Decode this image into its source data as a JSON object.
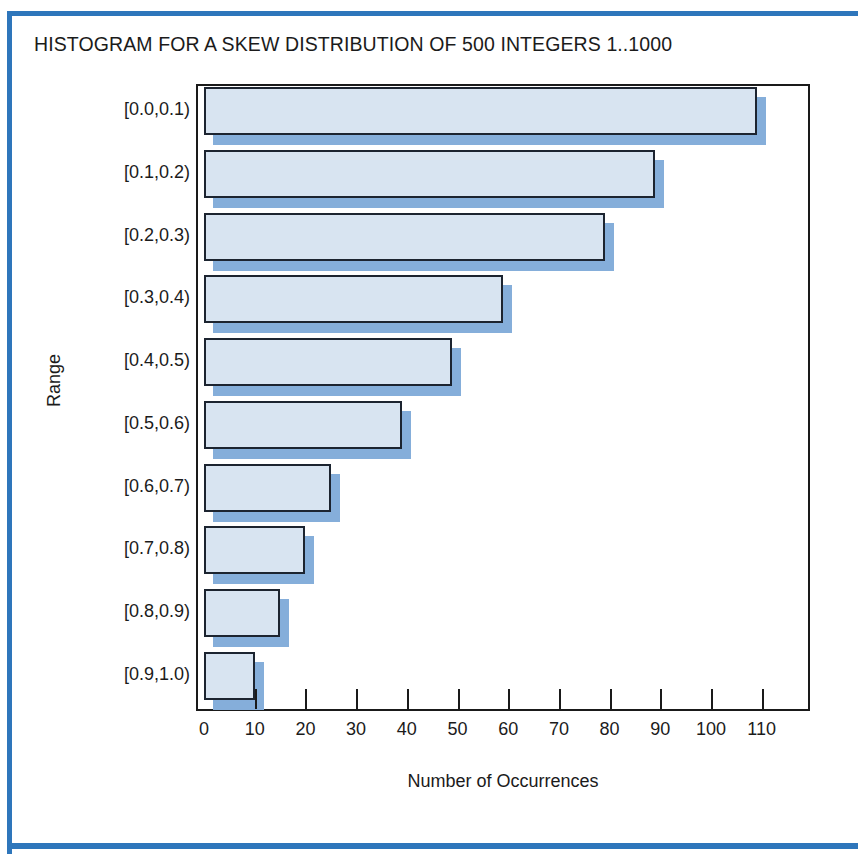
{
  "page": {
    "border_color": "#2e76bb",
    "background": "#ffffff"
  },
  "chart_data": {
    "type": "bar",
    "orientation": "horizontal",
    "title": "HISTOGRAM FOR A SKEW DISTRIBUTION OF 500 INTEGERS 1..1000",
    "xlabel": "Number of Occurrences",
    "ylabel": "Range",
    "categories": [
      "[0.0,0.1)",
      "[0.1,0.2)",
      "[0.2,0.3)",
      "[0.3,0.4)",
      "[0.4,0.5)",
      "[0.5,0.6)",
      "[0.6,0.7)",
      "[0.7,0.8)",
      "[0.8,0.9)",
      "[0.9,1.0)"
    ],
    "values": [
      109,
      89,
      79,
      59,
      49,
      39,
      25,
      20,
      15,
      10
    ],
    "xlim": [
      0,
      115
    ],
    "xticks": [
      0,
      10,
      20,
      30,
      40,
      50,
      60,
      70,
      80,
      90,
      100,
      110
    ],
    "xtick_labels": [
      "0",
      "10",
      "20",
      "30",
      "40",
      "50",
      "60",
      "70",
      "80",
      "90",
      "100",
      "110"
    ],
    "grid": false,
    "legend": null,
    "bar_fill_color": "#d8e4f1",
    "bar_edge_color": "#1c2430",
    "bar_shadow_color": "#85aeda",
    "axis_color": "#1a1a1a"
  }
}
